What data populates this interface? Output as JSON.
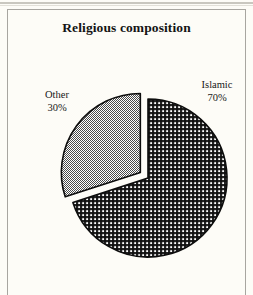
{
  "figure": {
    "title": "Religious composition",
    "frame": {
      "visible": true,
      "open_bottom": true,
      "color": "#a8a6a0"
    },
    "background": "#fdfcf7"
  },
  "labels": {
    "other": {
      "name": "Other",
      "percent": "30%"
    },
    "islamic": {
      "name": "Islamic",
      "percent": "70%"
    }
  },
  "chart_data": {
    "type": "pie",
    "title": "Religious composition",
    "xlabel": "",
    "ylabel": "",
    "categories": [
      "Islamic",
      "Other"
    ],
    "values": [
      70,
      30
    ],
    "units": "percent",
    "labels": [
      "Islamic\n70%",
      "Other\n30%"
    ],
    "start_angle_deg": 90,
    "direction": "clockwise",
    "explode": [
      0,
      0.12
    ],
    "legend": "none",
    "grid": false,
    "slice_styles": [
      {
        "name": "Islamic",
        "fill": "#3a3a3a",
        "pattern": "dense-crosshatch",
        "edge": "#0d0d0d"
      },
      {
        "name": "Other",
        "fill": "#9e9e9e",
        "pattern": "fine-checkerboard",
        "edge": "#0d0d0d"
      }
    ],
    "annotations": [
      {
        "text": "Other",
        "position": "left"
      },
      {
        "text": "30%",
        "position": "left"
      },
      {
        "text": "Islamic",
        "position": "right"
      },
      {
        "text": "70%",
        "position": "right"
      }
    ]
  }
}
